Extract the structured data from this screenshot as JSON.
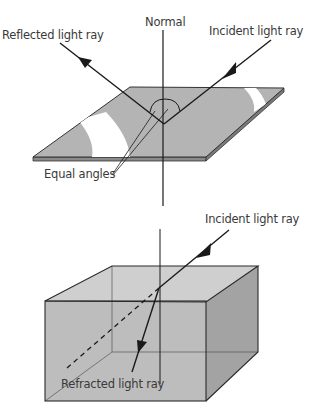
{
  "reflection": {
    "normal_label": "Normal",
    "reflected_label": "Reflected light ray",
    "incident_label": "Incident light ray",
    "equal_angles_label": "Equal angles"
  },
  "refraction": {
    "incident_label": "Incident light ray",
    "refracted_label": "Refracted light ray"
  },
  "colors": {
    "surface_gray": "#b4b4b4",
    "edge_dark": "#333333",
    "box_front": "#bdbdbd",
    "box_top": "#cfcfcf",
    "box_side": "#a3a3a3"
  }
}
